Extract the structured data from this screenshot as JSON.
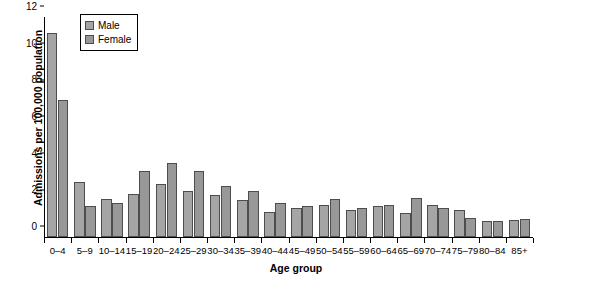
{
  "chart_data": {
    "type": "bar",
    "title": "",
    "subtitle": "",
    "xlabel": "Age group",
    "ylabel": "Admissions per 100,000 population",
    "ylim": [
      0,
      12
    ],
    "yticks": [
      0,
      2,
      4,
      6,
      8,
      10,
      12
    ],
    "grid": false,
    "legend_position": "top-left",
    "categories": [
      "0–4",
      "5–9",
      "10–14",
      "15–19",
      "20–24",
      "25–29",
      "30–34",
      "35–39",
      "40–44",
      "45–49",
      "50–54",
      "55–59",
      "60–64",
      "65–69",
      "70–74",
      "75–79",
      "80–84",
      "85+"
    ],
    "series": [
      {
        "name": "Male",
        "color": "#a5a5a5",
        "values": [
          11.15,
          3.0,
          2.1,
          2.35,
          2.9,
          2.5,
          2.3,
          2.0,
          1.35,
          1.6,
          1.75,
          1.45,
          1.7,
          1.3,
          1.75,
          1.5,
          0.85,
          0.95
        ]
      },
      {
        "name": "Female",
        "color": "#989898",
        "values": [
          7.45,
          1.7,
          1.85,
          3.6,
          4.05,
          3.6,
          2.8,
          2.5,
          1.85,
          1.7,
          2.1,
          1.6,
          1.75,
          2.15,
          1.6,
          1.05,
          0.9,
          1.0
        ]
      }
    ]
  },
  "legend": {
    "items": [
      {
        "label": "Male",
        "swatch": "male-swatch"
      },
      {
        "label": "Female",
        "swatch": "female-swatch"
      }
    ]
  }
}
